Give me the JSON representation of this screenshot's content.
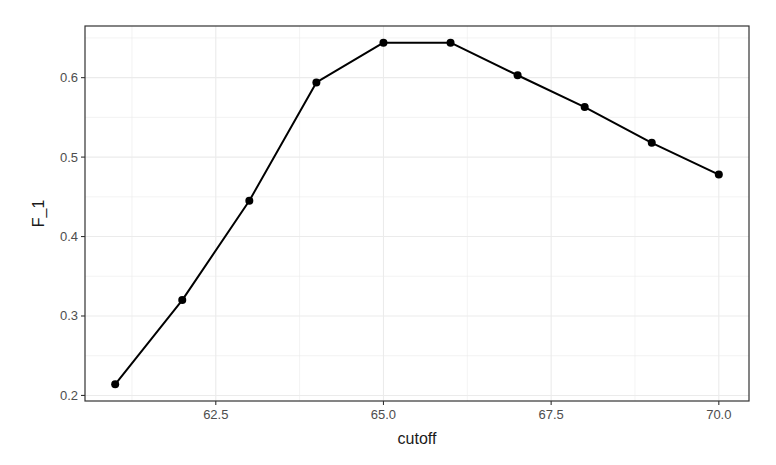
{
  "chart_data": {
    "type": "line",
    "title": "",
    "xlabel": "cutoff",
    "ylabel": "F_1",
    "x": [
      61,
      62,
      63,
      64,
      65,
      66,
      67,
      68,
      69,
      70
    ],
    "values": [
      0.214,
      0.32,
      0.445,
      0.594,
      0.644,
      0.644,
      0.603,
      0.563,
      0.518,
      0.478
    ],
    "xlim": [
      60.55,
      70.45
    ],
    "ylim": [
      0.193,
      0.665
    ],
    "xticks": [
      62.5,
      65.0,
      67.5,
      70.0
    ],
    "xtick_labels": [
      "62.5",
      "65.0",
      "67.5",
      "70.0"
    ],
    "yticks": [
      0.2,
      0.3,
      0.4,
      0.5,
      0.6
    ],
    "ytick_labels": [
      "0.2",
      "0.3",
      "0.4",
      "0.5",
      "0.6"
    ],
    "grid": true,
    "legend": null,
    "markers": true,
    "line_color": "#000000",
    "panel_border_color": "#333333",
    "grid_color": "#ebebeb"
  }
}
